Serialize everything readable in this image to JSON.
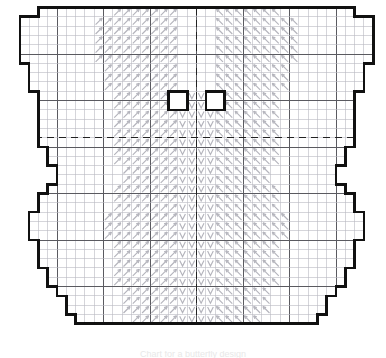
{
  "document": {
    "title": "Butterfly Cross-Stitch Chart",
    "kind": "needlework-grid-chart",
    "caption": "Chart for a butterfly design",
    "caption_visible": false
  },
  "grid": {
    "origin_x": 10.5,
    "origin_y": 7.5,
    "cell": 9.3,
    "cols": 40,
    "rows": 36,
    "minor_color": "#b9b9c2",
    "major_color": "#5a5a60",
    "major_every": 5,
    "outline_color": "#111111",
    "outline_width": 2.6,
    "center_line_color": "#222222",
    "center_line_dash": "7 5",
    "center_col": 20,
    "center_row": 14,
    "symbol_color": "#b4b4bc"
  },
  "legend": {
    "symbols": [
      {
        "name": "diagonal-long-stitch",
        "glyph": "slash-arrow",
        "region": "wings"
      },
      {
        "name": "chevron-stitch",
        "glyph": "down-arrow",
        "region": "body"
      }
    ]
  },
  "shape": {
    "name": "butterfly",
    "description": "Symmetric butterfly outline on a stitch grid with upper and lower wings, body and head notch",
    "half_outline_cols": [
      {
        "row": 0,
        "from": 3,
        "to": 10
      },
      {
        "row": 1,
        "from": 1,
        "to": 12
      },
      {
        "row": 2,
        "from": 1,
        "to": 13
      },
      {
        "row": 3,
        "from": 1,
        "to": 14
      },
      {
        "row": 4,
        "from": 1,
        "to": 15
      },
      {
        "row": 5,
        "from": 1,
        "to": 16
      },
      {
        "row": 6,
        "from": 2,
        "to": 17
      },
      {
        "row": 7,
        "from": 2,
        "to": 18
      },
      {
        "row": 8,
        "from": 2,
        "to": 18
      },
      {
        "row": 9,
        "from": 3,
        "to": 20
      },
      {
        "row": 10,
        "from": 3,
        "to": 20
      },
      {
        "row": 11,
        "from": 3,
        "to": 20
      },
      {
        "row": 12,
        "from": 3,
        "to": 20
      },
      {
        "row": 13,
        "from": 3,
        "to": 20
      },
      {
        "row": 14,
        "from": 3,
        "to": 20
      },
      {
        "row": 15,
        "from": 4,
        "to": 20
      },
      {
        "row": 16,
        "from": 4,
        "to": 20
      },
      {
        "row": 17,
        "from": 5,
        "to": 20
      },
      {
        "row": 18,
        "from": 5,
        "to": 20
      },
      {
        "row": 19,
        "from": 4,
        "to": 20
      },
      {
        "row": 20,
        "from": 3,
        "to": 20
      },
      {
        "row": 21,
        "from": 3,
        "to": 20
      },
      {
        "row": 22,
        "from": 2,
        "to": 20
      },
      {
        "row": 23,
        "from": 2,
        "to": 20
      },
      {
        "row": 24,
        "from": 2,
        "to": 20
      },
      {
        "row": 25,
        "from": 3,
        "to": 20
      },
      {
        "row": 26,
        "from": 3,
        "to": 20
      },
      {
        "row": 27,
        "from": 3,
        "to": 20
      },
      {
        "row": 28,
        "from": 4,
        "to": 20
      },
      {
        "row": 29,
        "from": 4,
        "to": 16
      },
      {
        "row": 30,
        "from": 5,
        "to": 14
      },
      {
        "row": 31,
        "from": 6,
        "to": 12
      },
      {
        "row": 32,
        "from": 6,
        "to": 10
      },
      {
        "row": 33,
        "from": 7,
        "to": 9
      }
    ]
  }
}
